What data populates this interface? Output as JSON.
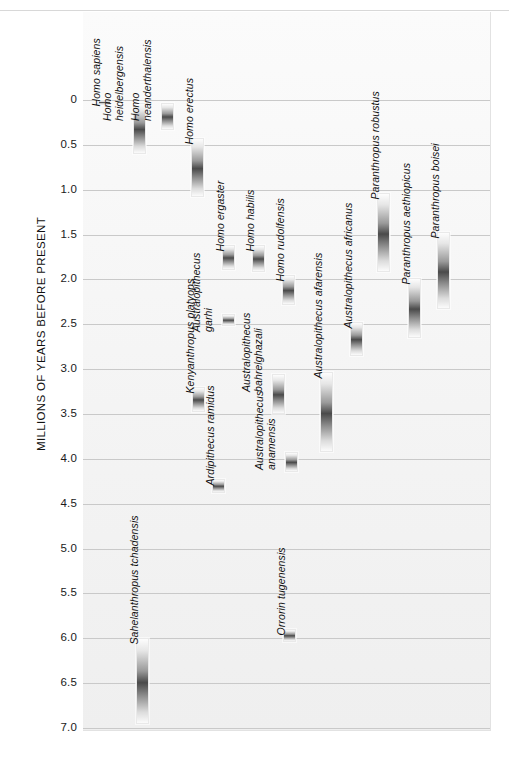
{
  "figure": {
    "axis_label": "MILLIONS OF YEARS BEFORE PRESENT"
  },
  "chart_data": {
    "type": "bar",
    "orientation": "vertical-ranges",
    "title": "",
    "xlabel": "",
    "ylabel": "MILLIONS OF YEARS BEFORE PRESENT",
    "ylim": [
      0,
      7.0
    ],
    "y_inverted": true,
    "grid": true,
    "legend": "none",
    "yticks": [
      "0",
      "0.5",
      "1.0",
      "1.5",
      "2.0",
      "2.5",
      "3.0",
      "3.5",
      "4.0",
      "4.5",
      "5.0",
      "5.5",
      "6.0",
      "6.5",
      "7.0"
    ],
    "ytick_values": [
      0,
      0.5,
      1.0,
      1.5,
      2.0,
      2.5,
      3.0,
      3.5,
      4.0,
      4.5,
      5.0,
      5.5,
      6.0,
      6.5,
      7.0
    ],
    "units": "millions of years before present",
    "series": [
      {
        "name": "Homo sapiens",
        "label_lines": [
          "Homo sapiens"
        ],
        "start": 0.0,
        "end": 0.06,
        "x": 98
      },
      {
        "name": "Homo heidelbergensis",
        "label_lines": [
          "Homo",
          "heidelbergensis"
        ],
        "start": 0.03,
        "end": 0.6,
        "x": 133
      },
      {
        "name": "Homo neanderthalensis",
        "label_lines": [
          "Homo",
          "neanderthalensis"
        ],
        "start": 0.03,
        "end": 0.33,
        "x": 161
      },
      {
        "name": "Homo erectus",
        "label_lines": [
          "Homo erectus"
        ],
        "start": 0.42,
        "end": 1.08,
        "x": 191
      },
      {
        "name": "Homo ergaster",
        "label_lines": [
          "Homo ergaster"
        ],
        "start": 1.62,
        "end": 1.9,
        "x": 222
      },
      {
        "name": "Homo habilis",
        "label_lines": [
          "Homo habilis"
        ],
        "start": 1.62,
        "end": 1.92,
        "x": 252
      },
      {
        "name": "Homo rudolfensis",
        "label_lines": [
          "Homo rudolfensis"
        ],
        "start": 1.95,
        "end": 2.28,
        "x": 282
      },
      {
        "name": "Kenyanthropus platyops",
        "label_lines": [
          "Kenyanthropus platyops"
        ],
        "start": 3.2,
        "end": 3.48,
        "x": 192
      },
      {
        "name": "Australopithecus garhi",
        "label_lines": [
          "Australopithecus",
          "garhi"
        ],
        "start": 2.38,
        "end": 2.52,
        "x": 222
      },
      {
        "name": "Ardipithecus ramidus",
        "label_lines": [
          "Ardipithecus ramidus"
        ],
        "start": 4.22,
        "end": 4.38,
        "x": 212
      },
      {
        "name": "Australopithecus bahrelghazali",
        "label_lines": [
          "Australopithecus",
          "bahrelghazali"
        ],
        "start": 3.05,
        "end": 3.5,
        "x": 272
      },
      {
        "name": "Australopithecus anamensis",
        "label_lines": [
          "Australopithecus",
          "anamensis"
        ],
        "start": 3.92,
        "end": 4.15,
        "x": 285
      },
      {
        "name": "Australopithecus afarensis",
        "label_lines": [
          "Australopithecus afarensis"
        ],
        "start": 3.03,
        "end": 3.92,
        "x": 320
      },
      {
        "name": "Australopithecus africanus",
        "label_lines": [
          "Australopithecus africanus"
        ],
        "start": 2.47,
        "end": 2.85,
        "x": 350
      },
      {
        "name": "Paranthropus robustus",
        "label_lines": [
          "Paranthropus robustus"
        ],
        "start": 1.04,
        "end": 1.92,
        "x": 377
      },
      {
        "name": "Paranthropus aethiopicus",
        "label_lines": [
          "Paranthropus aethiopicus"
        ],
        "start": 1.98,
        "end": 2.65,
        "x": 408
      },
      {
        "name": "Paranthropus boisei",
        "label_lines": [
          "Paranthropus boisei"
        ],
        "start": 1.47,
        "end": 2.33,
        "x": 437
      },
      {
        "name": "Sahelanthropus tchadensis",
        "label_lines": [
          "Sahelanthropus tchadensis"
        ],
        "start": 6.0,
        "end": 6.95,
        "x": 136
      },
      {
        "name": "Orrorin tugenensis",
        "label_lines": [
          "Orrorin tugenensis"
        ],
        "start": 5.9,
        "end": 6.04,
        "x": 283
      }
    ]
  }
}
